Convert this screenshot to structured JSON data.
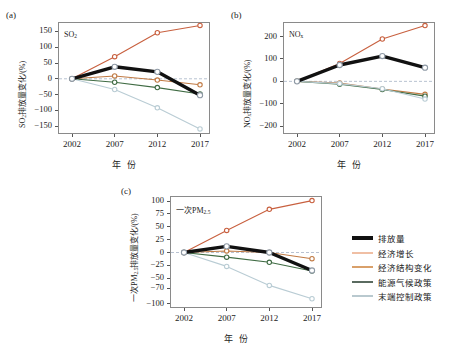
{
  "figure": {
    "panels": [
      {
        "letter": "(a)",
        "species": "SO",
        "species_sub": "2",
        "ylabel_prefix": "SO",
        "ylabel_sub": "2",
        "ylabel_suffix": "排放量变化/(%)",
        "xlabel": "年  份"
      },
      {
        "letter": "(b)",
        "species": "NO",
        "species_sub": "x",
        "ylabel_prefix": "NO",
        "ylabel_sub": "x",
        "ylabel_suffix": "排放量变化/(%)",
        "xlabel": "年  份"
      },
      {
        "letter": "(c)",
        "species": "一次PM",
        "species_sub": "2.5",
        "ylabel_prefix": "一次PM",
        "ylabel_sub": "2.5",
        "ylabel_suffix": "排放量变化/(%)",
        "xlabel": "年  份"
      }
    ]
  },
  "legend": {
    "items": [
      {
        "label": "排放量",
        "color": "#111111",
        "width": 4
      },
      {
        "label": "经济增长",
        "color": "#f0bfa4",
        "width": 2
      },
      {
        "label": "经济结构变化",
        "color": "#d9a06a",
        "width": 2
      },
      {
        "label": "能源气候政策",
        "color": "#5a6b60",
        "width": 2
      },
      {
        "label": "末端控制政策",
        "color": "#b9c9cf",
        "width": 2
      }
    ]
  },
  "chart_data": [
    {
      "type": "line",
      "panel": "(a)",
      "title": "SO2",
      "xlabel": "年  份",
      "ylabel": "SO2排放量变化/(%)",
      "x": [
        2002,
        2007,
        2012,
        2017
      ],
      "xticks": [
        "2002",
        "2007",
        "2012",
        "2017"
      ],
      "yticks": [
        150,
        100,
        50,
        0,
        -50,
        -100,
        -150
      ],
      "ylim": [
        -175,
        180
      ],
      "grid": false,
      "zero_line": true,
      "legend_position": "external-right",
      "series": [
        {
          "name": "排放量",
          "color": "#111111",
          "values": [
            0,
            38,
            22,
            -52
          ]
        },
        {
          "name": "经济增长",
          "color": "#c8603f",
          "values": [
            0,
            70,
            146,
            169
          ]
        },
        {
          "name": "经济结构变化",
          "color": "#c07a44",
          "values": [
            0,
            9,
            -4,
            -19
          ]
        },
        {
          "name": "能源气候政策",
          "color": "#3f6b43",
          "values": [
            0,
            -11,
            -28,
            -48
          ]
        },
        {
          "name": "末端控制政策",
          "color": "#b9ccd4",
          "values": [
            0,
            -34,
            -92,
            -159
          ]
        }
      ]
    },
    {
      "type": "line",
      "panel": "(b)",
      "title": "NOx",
      "xlabel": "年  份",
      "ylabel": "NOx排放量变化/(%)",
      "x": [
        2002,
        2007,
        2012,
        2017
      ],
      "xticks": [
        "2002",
        "2007",
        "2012",
        "2017"
      ],
      "yticks": [
        200,
        100,
        0,
        -100,
        -200
      ],
      "ylim": [
        -235,
        265
      ],
      "grid": false,
      "zero_line": true,
      "legend_position": "external-right",
      "series": [
        {
          "name": "排放量",
          "color": "#111111",
          "values": [
            0,
            73,
            113,
            61
          ]
        },
        {
          "name": "经济增长",
          "color": "#c8603f",
          "values": [
            0,
            80,
            189,
            249
          ]
        },
        {
          "name": "经济结构变化",
          "color": "#c07a44",
          "values": [
            0,
            -7,
            -34,
            -58
          ]
        },
        {
          "name": "能源气候政策",
          "color": "#3f6b43",
          "values": [
            0,
            -13,
            -36,
            -66
          ]
        },
        {
          "name": "末端控制政策",
          "color": "#b9ccd4",
          "values": [
            0,
            -10,
            -33,
            -79
          ]
        }
      ]
    },
    {
      "type": "line",
      "panel": "(c)",
      "title": "一次PM2.5",
      "xlabel": "年  份",
      "ylabel": "一次PM2.5排放量变化/(%)",
      "x": [
        2002,
        2007,
        2012,
        2017
      ],
      "xticks": [
        "2002",
        "2007",
        "2012",
        "2017"
      ],
      "yticks": [
        100,
        75,
        50,
        25,
        0,
        -25,
        -50,
        -70,
        -100
      ],
      "ylim": [
        -108,
        110
      ],
      "grid": false,
      "zero_line": true,
      "legend_position": "external-right",
      "series": [
        {
          "name": "排放量",
          "color": "#111111",
          "values": [
            0,
            12,
            0,
            -35
          ]
        },
        {
          "name": "经济增长",
          "color": "#c8603f",
          "values": [
            0,
            43,
            84,
            101
          ]
        },
        {
          "name": "经济结构变化",
          "color": "#c07a44",
          "values": [
            0,
            3,
            0,
            -12
          ]
        },
        {
          "name": "能源气候政策",
          "color": "#3f6b43",
          "values": [
            0,
            -9,
            -19,
            -36
          ]
        },
        {
          "name": "末端控制政策",
          "color": "#b9ccd4",
          "values": [
            0,
            -27,
            -64,
            -90
          ]
        }
      ]
    }
  ]
}
